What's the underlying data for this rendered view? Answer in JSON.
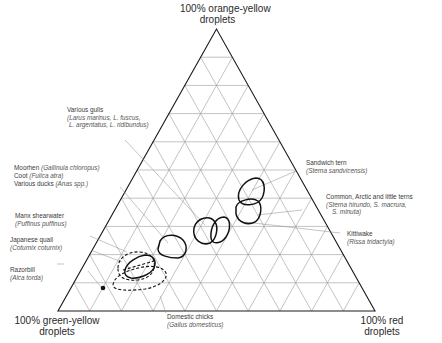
{
  "diagram": {
    "type": "ternary",
    "vertices": {
      "top": {
        "line1": "100% orange-yellow",
        "line2": "droplets"
      },
      "bottom_left": {
        "line1": "100% green-yellow",
        "line2": "droplets"
      },
      "bottom_right": {
        "line1": "100% red",
        "line2": "droplets"
      }
    },
    "grid_divisions": 10,
    "colors": {
      "outline": "#1a1a1a",
      "grid": "#9a9a9a",
      "curve": "#111111",
      "leader": "#8a8a8a"
    },
    "species": [
      {
        "id": "gulls",
        "name": "Various gulls",
        "scientific_lines": [
          "(Larus marinus, L. fuscus,",
          "L. argentatus, L. ridibundus)"
        ]
      },
      {
        "id": "moorhen",
        "name": "Moorhen",
        "scientific": "(Gallinula chloropus)"
      },
      {
        "id": "coot",
        "name": "Coot",
        "scientific": "(Fulica atra)"
      },
      {
        "id": "ducks",
        "name": "Various ducks",
        "scientific": "(Anas spp.)"
      },
      {
        "id": "shearwater",
        "name": "Manx shearwater",
        "scientific": "(Puffinus puffinus)"
      },
      {
        "id": "quail",
        "name": "Japanese quail",
        "scientific": "(Coturnix coturnix)"
      },
      {
        "id": "razorbill",
        "name": "Razorbill",
        "scientific": "(Alca torda)"
      },
      {
        "id": "chicks",
        "name": "Domestic chicks",
        "scientific": "(Gallus domesticus)"
      },
      {
        "id": "sandwich_tern",
        "name": "Sandwich tern",
        "scientific": "(Sterna sandvicensis)"
      },
      {
        "id": "terns",
        "name": "Common, Arctic and little terns",
        "scientific_lines": [
          "(Sterna hirundo, S. macrura,",
          "S. minuta)"
        ]
      },
      {
        "id": "kittiwake",
        "name": "Kittiwake",
        "scientific": "(Rissa tridactyla)"
      }
    ]
  }
}
